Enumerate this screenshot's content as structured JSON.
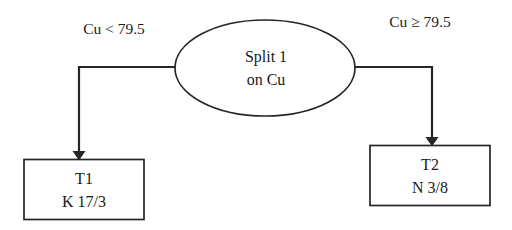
{
  "diagram": {
    "type": "decision-tree",
    "title": "",
    "background_color": "#ffffff",
    "stroke_color": "#262626",
    "text_color": "#1a1a1a",
    "root": {
      "id": "split-1",
      "shape": "ellipse",
      "line1": "Split 1",
      "line2": "on Cu",
      "variable": "Cu",
      "threshold": "79.5"
    },
    "edges": [
      {
        "id": "edge-left",
        "label": "Cu < 79.5",
        "direction": "left",
        "target": "leaf-t1"
      },
      {
        "id": "edge-right",
        "label": "Cu ≥ 79.5",
        "direction": "right",
        "target": "leaf-t2"
      }
    ],
    "leaves": [
      {
        "id": "leaf-t1",
        "shape": "rectangle",
        "line1": "T1",
        "line2": "K 17/3",
        "class_label": "K",
        "counts": "17/3"
      },
      {
        "id": "leaf-t2",
        "shape": "rectangle",
        "line1": "T2",
        "line2": "N 3/8",
        "class_label": "N",
        "counts": "3/8"
      }
    ]
  }
}
